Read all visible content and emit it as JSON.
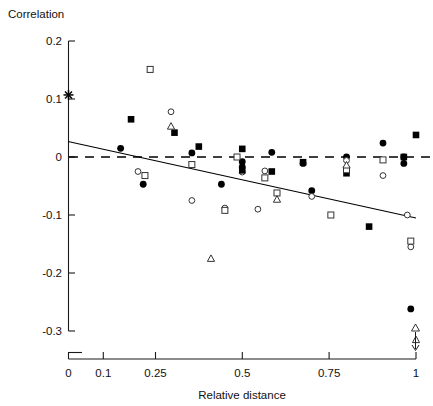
{
  "chart_data": {
    "type": "scatter",
    "title": "",
    "ylabel": "Correlation",
    "xlabel": "Relative distance",
    "ylim": [
      -0.3,
      0.2
    ],
    "xlim": [
      0,
      1
    ],
    "grid": false,
    "legend": "none",
    "y_ticks": [
      "0.2",
      "0.1",
      "0",
      "-0.1",
      "-0.2",
      "-0.3"
    ],
    "y_tick_values": [
      0.2,
      0.1,
      0,
      -0.1,
      -0.2,
      -0.3
    ],
    "x_ticks": [
      "0",
      "0.1",
      "0.25",
      "0.5",
      "0.75",
      "1"
    ],
    "x_tick_values": [
      0,
      0.1,
      0.25,
      0.5,
      0.75,
      1
    ],
    "annotations": [
      {
        "name": "zero-reference-line",
        "style": "dashed",
        "y": 0
      },
      {
        "name": "regression-line",
        "style": "solid",
        "x0": 0.0,
        "y0": 0.027,
        "x1": 1.0,
        "y1": -0.105
      },
      {
        "name": "off-scale-arrow",
        "x": 1.0,
        "note": "downward arrow below axis at x=1 with open triangle marker"
      }
    ],
    "series": [
      {
        "name": "asterisk",
        "marker": "asterisk",
        "points": [
          [
            0.0,
            0.107
          ]
        ]
      },
      {
        "name": "filled-circle",
        "marker": "filled-circle",
        "points": [
          [
            0.15,
            0.015
          ],
          [
            0.215,
            -0.047
          ],
          [
            0.355,
            0.007
          ],
          [
            0.44,
            -0.047
          ],
          [
            0.5,
            -0.008
          ],
          [
            0.5,
            -0.017
          ],
          [
            0.585,
            0.008
          ],
          [
            0.675,
            -0.011
          ],
          [
            0.7,
            -0.058
          ],
          [
            0.8,
            0.0
          ],
          [
            0.905,
            0.024
          ],
          [
            0.965,
            0.0
          ],
          [
            0.965,
            -0.011
          ],
          [
            0.985,
            -0.262
          ]
        ]
      },
      {
        "name": "open-circle",
        "marker": "open-circle",
        "points": [
          [
            0.2,
            -0.025
          ],
          [
            0.295,
            0.078
          ],
          [
            0.355,
            -0.075
          ],
          [
            0.45,
            -0.088
          ],
          [
            0.5,
            -0.026
          ],
          [
            0.545,
            -0.09
          ],
          [
            0.565,
            -0.024
          ],
          [
            0.7,
            -0.068
          ],
          [
            0.8,
            -0.006
          ],
          [
            0.905,
            -0.032
          ],
          [
            0.975,
            -0.1
          ],
          [
            0.985,
            -0.155
          ]
        ]
      },
      {
        "name": "filled-square",
        "marker": "filled-square",
        "points": [
          [
            0.18,
            0.065
          ],
          [
            0.305,
            0.042
          ],
          [
            0.375,
            0.018
          ],
          [
            0.5,
            0.014
          ],
          [
            0.5,
            -0.023
          ],
          [
            0.585,
            -0.025
          ],
          [
            0.675,
            -0.009
          ],
          [
            0.8,
            -0.028
          ],
          [
            0.865,
            -0.12
          ],
          [
            0.965,
            0.0
          ],
          [
            1.0,
            0.038
          ]
        ]
      },
      {
        "name": "open-square",
        "marker": "open-square",
        "points": [
          [
            0.235,
            0.151
          ],
          [
            0.22,
            -0.032
          ],
          [
            0.355,
            -0.013
          ],
          [
            0.45,
            -0.092
          ],
          [
            0.485,
            0.0
          ],
          [
            0.565,
            -0.036
          ],
          [
            0.6,
            -0.062
          ],
          [
            0.755,
            -0.1
          ],
          [
            0.8,
            -0.022
          ],
          [
            0.905,
            -0.005
          ],
          [
            0.985,
            -0.145
          ]
        ]
      },
      {
        "name": "open-triangle",
        "marker": "open-triangle",
        "points": [
          [
            0.295,
            0.053
          ],
          [
            0.41,
            -0.175
          ],
          [
            0.6,
            -0.073
          ],
          [
            0.8,
            -0.014
          ],
          [
            1.0,
            -0.315
          ]
        ]
      }
    ]
  }
}
